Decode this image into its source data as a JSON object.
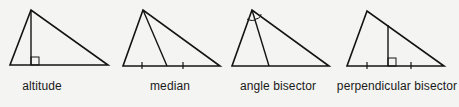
{
  "figure": {
    "background": "#f4f4f2",
    "stroke_color": "#141414",
    "panels": [
      {
        "id": "altitude",
        "label": "altitude",
        "label_x": 42,
        "triangle": [
          [
            31,
            10
          ],
          [
            10,
            65
          ],
          [
            108,
            65
          ]
        ],
        "segment": [
          [
            31,
            10
          ],
          [
            31,
            65
          ]
        ],
        "right_angle_box": {
          "x": 31,
          "y": 57,
          "size": 8
        },
        "ticks": []
      },
      {
        "id": "median",
        "label": "median",
        "label_x": 170,
        "triangle": [
          [
            143,
            10
          ],
          [
            123,
            66
          ],
          [
            220,
            66
          ]
        ],
        "segment": [
          [
            143,
            10
          ],
          [
            167,
            66
          ]
        ],
        "right_angle_box": null,
        "ticks": [
          142,
          183
        ]
      },
      {
        "id": "angle-bisector",
        "label": "angle bisector",
        "label_x": 278,
        "triangle": [
          [
            252,
            10
          ],
          [
            232,
            66
          ],
          [
            329,
            66
          ]
        ],
        "segment": [
          [
            252,
            10
          ],
          [
            269,
            66
          ]
        ],
        "right_angle_box": null,
        "ticks": [],
        "angle_arcs": true
      },
      {
        "id": "perpendicular-bisector",
        "label": "perpendicular bisector",
        "label_x": 397,
        "triangle": [
          [
            367,
            11
          ],
          [
            347,
            66
          ],
          [
            444,
            66
          ]
        ],
        "segment": [
          [
            388,
            25
          ],
          [
            388,
            66
          ]
        ],
        "right_angle_box": {
          "x": 388,
          "y": 58,
          "size": 8
        },
        "ticks": [
          367,
          411
        ]
      }
    ]
  }
}
